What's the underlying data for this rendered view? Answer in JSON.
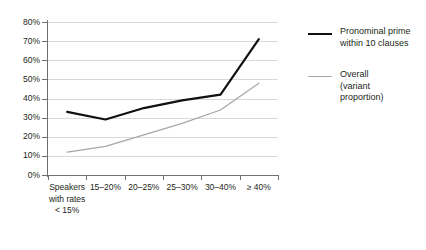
{
  "chart_data": {
    "type": "line",
    "title": "",
    "subtitle": "",
    "xlabel": "",
    "ylabel": "",
    "ylim": [
      0,
      80
    ],
    "ytick_labels": [
      "0%",
      "10%",
      "20%",
      "30%",
      "40%",
      "50%",
      "60%",
      "70%",
      "80%"
    ],
    "ytick_values": [
      0,
      10,
      20,
      30,
      40,
      50,
      60,
      70,
      80
    ],
    "grid": true,
    "legend_position": "right",
    "categories": [
      "Speakers\nwith rates\n< 15%",
      "15–20%",
      "20–25%",
      "25–30%",
      "30–40%",
      "≥ 40%"
    ],
    "series": [
      {
        "name": "Pronominal prime\nwithin 10 clauses",
        "color": "#111111",
        "values": [
          33,
          29,
          35,
          39,
          42,
          71
        ]
      },
      {
        "name": "Overall\n(variant\nproportion)",
        "color": "#a6a6a6",
        "values": [
          12,
          15,
          21,
          27,
          34,
          48
        ]
      }
    ]
  },
  "legend": {
    "items": [
      {
        "label": "Pronominal prime\nwithin 10 clauses",
        "swatch": "dark"
      },
      {
        "label": "Overall\n(variant\nproportion)",
        "swatch": "light"
      }
    ]
  },
  "colors": {
    "axis": "#6f6f6f",
    "grid": "#d9d9d9",
    "series_dark": "#111111",
    "series_light": "#a6a6a6",
    "text": "#231f20",
    "background": "#ffffff"
  }
}
